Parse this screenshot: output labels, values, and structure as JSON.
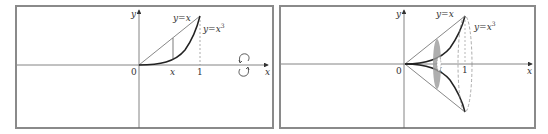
{
  "figure": {
    "left_panel": {
      "axis_labels": {
        "x": "x",
        "y": "y"
      },
      "origin_label": "0",
      "tick_labels": {
        "x_point": "x",
        "one": "1"
      },
      "curve_labels": {
        "line": "y=x",
        "cubic": "y=x",
        "cubic_exp": "3"
      },
      "rotation_icon": "rotate-about-x-axis-icon"
    },
    "right_panel": {
      "axis_labels": {
        "x": "x",
        "y": "y"
      },
      "origin_label": "0",
      "tick_labels": {
        "x_point": "x",
        "one": "1"
      },
      "curve_labels": {
        "line": "y=x",
        "cubic": "y=x",
        "cubic_exp": "3"
      }
    },
    "colors": {
      "frame": "#8a8a8a",
      "axis": "#555555",
      "curve": "#222222",
      "line": "#444444",
      "shaded": "#9a9a9a",
      "dashed": "#888888"
    }
  }
}
